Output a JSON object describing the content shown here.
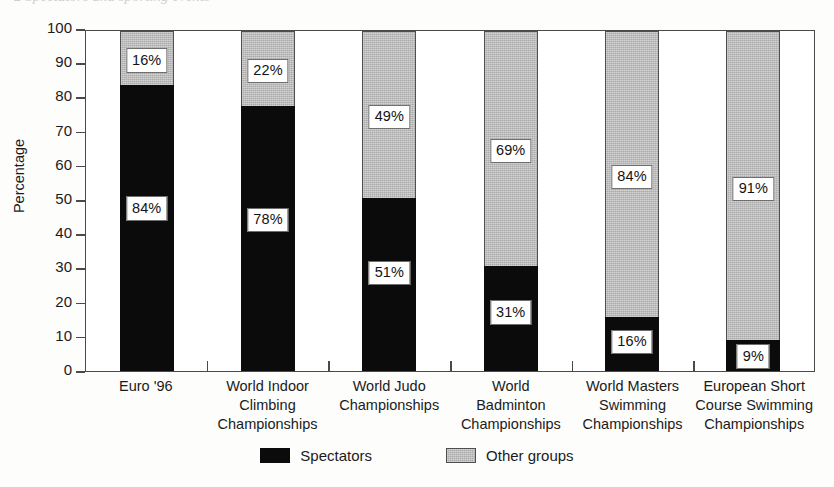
{
  "page": {
    "running_header": "2  Spectators and sporting events"
  },
  "chart_data": {
    "type": "bar",
    "subtype": "stacked-100",
    "title": "",
    "xlabel": "",
    "ylabel": "Percentage",
    "ylim": [
      0,
      100
    ],
    "ytick_step": 10,
    "yticks": [
      100,
      90,
      80,
      70,
      60,
      50,
      40,
      30,
      20,
      10,
      0
    ],
    "grid": false,
    "legend_position": "bottom-center",
    "categories": [
      "Euro '96",
      "World Indoor Climbing Championships",
      "World Judo Championships",
      "World Badminton Championships",
      "World Masters Swimming Championships",
      "European Short Course Swimming Championships"
    ],
    "category_label_lines": [
      [
        "Euro '96"
      ],
      [
        "World Indoor",
        "Climbing",
        "Championships"
      ],
      [
        "World Judo",
        "Championships"
      ],
      [
        "World",
        "Badminton",
        "Championships"
      ],
      [
        "World Masters",
        "Swimming",
        "Championships"
      ],
      [
        "European Short",
        "Course Swimming",
        "Championships"
      ]
    ],
    "series": [
      {
        "name": "Spectators",
        "color": "#0b0b0b",
        "values": [
          84,
          78,
          51,
          31,
          16,
          9
        ],
        "value_labels": [
          "84%",
          "78%",
          "51%",
          "31%",
          "16%",
          "9%"
        ]
      },
      {
        "name": "Other groups",
        "color": "#aaaaab",
        "values": [
          16,
          22,
          49,
          69,
          84,
          91
        ],
        "value_labels": [
          "16%",
          "22%",
          "49%",
          "69%",
          "84%",
          "91%"
        ]
      }
    ]
  },
  "legend": {
    "items": [
      {
        "label": "Spectators",
        "swatch": "black-filled-swatch"
      },
      {
        "label": "Other groups",
        "swatch": "gray-filled-swatch"
      }
    ]
  }
}
